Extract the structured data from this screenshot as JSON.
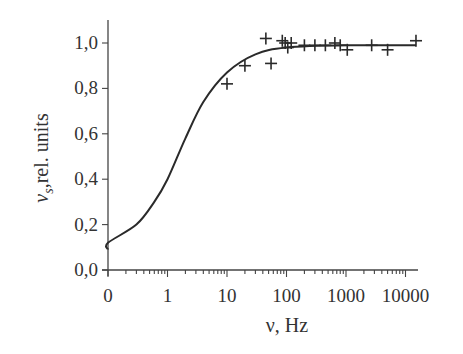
{
  "chart_data": {
    "type": "scatter",
    "title": "",
    "xlabel": "ν, Hz",
    "ylabel": "v_s,rel. units",
    "ylabel_main": "v",
    "ylabel_sub": "s",
    "ylabel_rest": ",rel. units",
    "x_scale": "log (with 0 origin)",
    "x_ticks": [
      "0",
      "1",
      "10",
      "100",
      "1000",
      "10000"
    ],
    "y_ticks": [
      "0,0",
      "0,2",
      "0,4",
      "0,6",
      "0,8",
      "1,0"
    ],
    "ylim": [
      0,
      1.0
    ],
    "grid": false,
    "legend": "none",
    "series": [
      {
        "name": "measured",
        "marker": "+",
        "points": [
          {
            "x": 10,
            "y": 0.82
          },
          {
            "x": 20,
            "y": 0.9
          },
          {
            "x": 45,
            "y": 1.02
          },
          {
            "x": 55,
            "y": 0.91
          },
          {
            "x": 85,
            "y": 1.01
          },
          {
            "x": 95,
            "y": 1.0
          },
          {
            "x": 105,
            "y": 0.98
          },
          {
            "x": 120,
            "y": 1.0
          },
          {
            "x": 200,
            "y": 0.99
          },
          {
            "x": 300,
            "y": 0.99
          },
          {
            "x": 450,
            "y": 0.99
          },
          {
            "x": 650,
            "y": 1.0
          },
          {
            "x": 800,
            "y": 0.99
          },
          {
            "x": 1050,
            "y": 0.97
          },
          {
            "x": 2700,
            "y": 0.99
          },
          {
            "x": 5000,
            "y": 0.97
          },
          {
            "x": 15000,
            "y": 1.01
          }
        ]
      },
      {
        "name": "model",
        "line": "solid",
        "points": [
          {
            "x": 0,
            "y": 0.09
          },
          {
            "x": 0.1,
            "y": 0.12
          },
          {
            "x": 0.3,
            "y": 0.2
          },
          {
            "x": 0.6,
            "y": 0.3
          },
          {
            "x": 1,
            "y": 0.4
          },
          {
            "x": 2,
            "y": 0.58
          },
          {
            "x": 4,
            "y": 0.74
          },
          {
            "x": 10,
            "y": 0.87
          },
          {
            "x": 30,
            "y": 0.95
          },
          {
            "x": 100,
            "y": 0.98
          },
          {
            "x": 1000,
            "y": 0.99
          },
          {
            "x": 15000,
            "y": 0.99
          }
        ]
      }
    ]
  }
}
